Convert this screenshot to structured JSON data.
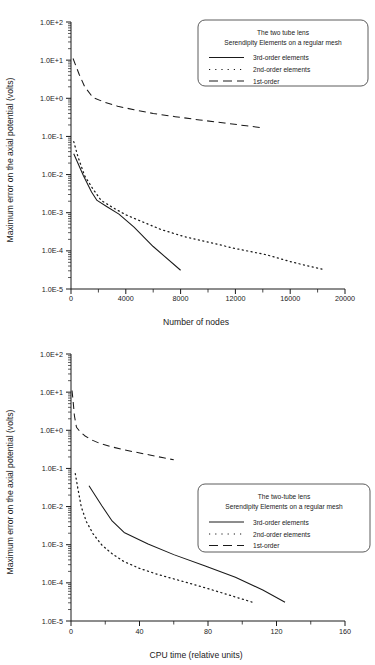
{
  "figure": {
    "background": "#ffffff",
    "ink": "#1a1a1a",
    "top_faint_text": "",
    "charts": [
      {
        "id": "chart-nodes",
        "legend_position": "top-right",
        "legend": {
          "title_line1": "The two tube lens",
          "title_line2": "Serendipity Elements on a regular mesh",
          "entries": [
            {
              "label": "3rd-order elements",
              "style": "solid"
            },
            {
              "label": "2nd-order elements",
              "style": "dotted"
            },
            {
              "label": "1st-order",
              "style": "dashed"
            }
          ]
        },
        "xlabel": "Number of nodes",
        "ylabel": "Maximum error on the axial potential (volts)",
        "xticks": [
          "0",
          "4000",
          "8000",
          "12000",
          "16000",
          "20000"
        ],
        "yticks": [
          "1.0E+2",
          "1.0E+1",
          "1.0E+0",
          "1.0E-1",
          "1.0E-2",
          "1.0E-3",
          "1.0E-4",
          "1.0E-5"
        ]
      },
      {
        "id": "chart-cputime",
        "legend_position": "middle-right",
        "legend": {
          "title_line1": "The two-tube lens",
          "title_line2": "Serendipity Elements on a regular mesh",
          "entries": [
            {
              "label": "3rd-order elements",
              "style": "solid"
            },
            {
              "label": "2nd-order elements",
              "style": "dotted"
            },
            {
              "label": "1st-order",
              "style": "dashed"
            }
          ]
        },
        "xlabel": "CPU time (relative units)",
        "ylabel": "Maximum error on the axial potential (volts)",
        "xticks": [
          "0.00",
          "40.00",
          "80.00",
          "120.00",
          "160.00"
        ],
        "yticks": [
          "1.0E+2",
          "1.0E+1",
          "1.0E+0",
          "1.0E-1",
          "1.0E-2",
          "1.0E-3",
          "1.0E-4",
          "1.0E-5"
        ]
      }
    ]
  },
  "chart_data": [
    {
      "type": "line",
      "id": "chart-nodes",
      "title": "The two tube lens — Serendipity Elements on a regular mesh",
      "xlabel": "Number of nodes",
      "ylabel": "Maximum error on the axial potential (volts)",
      "xlim": [
        0,
        20000
      ],
      "ylim": [
        1e-05,
        100.0
      ],
      "yscale": "log",
      "xscale": "linear",
      "grid": false,
      "legend_position": "top-right",
      "xticks": [
        0,
        4000,
        8000,
        12000,
        16000,
        20000
      ],
      "yticks": [
        100,
        10,
        1,
        0.1,
        0.01,
        0.001,
        0.0001,
        1e-05
      ],
      "ytick_labels": [
        "1.0E+2",
        "1.0E+1",
        "1.0E+0",
        "1.0E-1",
        "1.0E-2",
        "1.0E-3",
        "1.0E-4",
        "1.0E-5"
      ],
      "series": [
        {
          "name": "3rd-order elements",
          "style": "solid",
          "x": [
            200,
            450,
            900,
            1500,
            1900,
            2600,
            3500,
            4600,
            6000,
            8000
          ],
          "y": [
            0.035,
            0.022,
            0.0095,
            0.0035,
            0.0021,
            0.00145,
            0.00092,
            0.00042,
            0.00013,
            3.1e-05
          ]
        },
        {
          "name": "2nd-order elements",
          "style": "dotted",
          "x": [
            200,
            500,
            1000,
            1600,
            2200,
            3000,
            4000,
            5200,
            6600,
            8200,
            10000,
            12000,
            14200,
            16200,
            18500
          ],
          "y": [
            0.073,
            0.03,
            0.0092,
            0.0042,
            0.0021,
            0.0014,
            0.00088,
            0.00058,
            0.00036,
            0.00024,
            0.00017,
            0.000115,
            8e-05,
            5e-05,
            3.2e-05
          ]
        },
        {
          "name": "1st-order",
          "style": "dashed",
          "x": [
            150,
            300,
            600,
            1000,
            1600,
            2400,
            3400,
            4600,
            6000,
            7600,
            9400,
            11200,
            12800,
            14000
          ],
          "y": [
            11.0,
            8.0,
            4.2,
            2.0,
            1.05,
            0.8,
            0.62,
            0.5,
            0.4,
            0.33,
            0.27,
            0.225,
            0.19,
            0.168
          ]
        }
      ]
    },
    {
      "type": "line",
      "id": "chart-cputime",
      "title": "The two-tube lens — Serendipity Elements on a regular mesh",
      "xlabel": "CPU time (relative units)",
      "ylabel": "Maximum error on the axial potential (volts)",
      "xlim": [
        0,
        160
      ],
      "ylim": [
        1e-05,
        100.0
      ],
      "yscale": "log",
      "xscale": "linear",
      "grid": false,
      "legend_position": "middle-right",
      "xticks": [
        0,
        40,
        80,
        120,
        160
      ],
      "yticks": [
        100,
        10,
        1,
        0.1,
        0.01,
        0.001,
        0.0001,
        1e-05
      ],
      "ytick_labels": [
        "1.0E+2",
        "1.0E+1",
        "1.0E+0",
        "1.0E-1",
        "1.0E-2",
        "1.0E-3",
        "1.0E-4",
        "1.0E-5"
      ],
      "series": [
        {
          "name": "3rd-order elements",
          "style": "solid",
          "x": [
            10.5,
            18,
            24,
            31,
            45,
            60,
            78,
            96,
            112,
            125
          ],
          "y": [
            0.035,
            0.0105,
            0.0042,
            0.0021,
            0.00105,
            0.00055,
            0.00028,
            0.00014,
            6.5e-05,
            3.1e-05
          ]
        },
        {
          "name": "2nd-order elements",
          "style": "dotted",
          "x": [
            2.5,
            4,
            6,
            9,
            13,
            18,
            24,
            31,
            40,
            50,
            62,
            75,
            88,
            98,
            106
          ],
          "y": [
            0.073,
            0.03,
            0.0098,
            0.004,
            0.0019,
            0.00098,
            0.00058,
            0.00036,
            0.00024,
            0.00017,
            0.00012,
            8.2e-05,
            5.5e-05,
            4e-05,
            3.1e-05
          ]
        },
        {
          "name": "1st-order",
          "style": "dashed",
          "x": [
            0.6,
            1.2,
            2.0,
            3.2,
            5.0,
            8.0,
            12.0,
            17.0,
            23.0,
            30.0,
            38.0,
            46.0,
            54.0,
            60.0
          ],
          "y": [
            11.0,
            6.0,
            2.4,
            1.2,
            0.95,
            0.72,
            0.56,
            0.45,
            0.375,
            0.315,
            0.265,
            0.225,
            0.19,
            0.168
          ]
        }
      ]
    }
  ]
}
